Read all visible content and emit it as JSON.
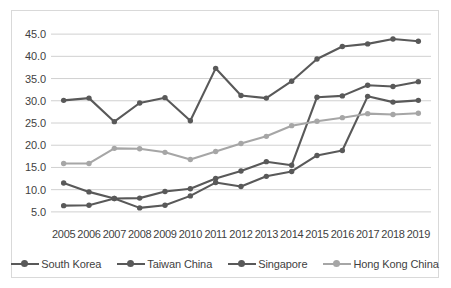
{
  "chart_data": {
    "type": "line",
    "title": "",
    "subtitle": "",
    "xlabel": "",
    "ylabel": "",
    "categories": [
      "2005",
      "2006",
      "2007",
      "2008",
      "2009",
      "2010",
      "2011",
      "2012",
      "2013",
      "2014",
      "2015",
      "2016",
      "2017",
      "2018",
      "2019"
    ],
    "x": [
      2005,
      2006,
      2007,
      2008,
      2009,
      2010,
      2011,
      2012,
      2013,
      2014,
      2015,
      2016,
      2017,
      2018,
      2019
    ],
    "ylim": [
      2.5,
      47.5
    ],
    "yticks": [
      5.0,
      10.0,
      15.0,
      20.0,
      25.0,
      30.0,
      35.0,
      40.0,
      45.0
    ],
    "ytick_labels": [
      "5.0",
      "10.0",
      "15.0",
      "20.0",
      "25.0",
      "30.0",
      "35.0",
      "40.0",
      "45.0"
    ],
    "grid": true,
    "grid_axis": "y",
    "legend_position": "bottom",
    "markers": "circle",
    "series": [
      {
        "name": "South Korea",
        "color": "#595959",
        "values": [
          30.1,
          30.6,
          25.3,
          29.5,
          30.7,
          25.5,
          37.3,
          31.2,
          30.6,
          34.4,
          39.4,
          42.2,
          42.8,
          43.9,
          43.4
        ]
      },
      {
        "name": "Taiwan China",
        "color": "#595959",
        "values": [
          11.5,
          9.5,
          8.0,
          8.1,
          9.6,
          10.2,
          12.5,
          14.2,
          16.3,
          15.5,
          30.8,
          31.1,
          33.5,
          33.2,
          34.3
        ]
      },
      {
        "name": "Singapore",
        "color": "#595959",
        "values": [
          6.4,
          6.5,
          8.0,
          5.9,
          6.5,
          8.6,
          11.6,
          10.7,
          13.0,
          14.1,
          17.7,
          18.8,
          31.0,
          29.7,
          30.1
        ]
      },
      {
        "name": "Hong Kong China",
        "color": "#a6a6a6",
        "values": [
          15.9,
          15.9,
          19.3,
          19.2,
          18.4,
          16.8,
          18.6,
          20.4,
          22.0,
          24.4,
          25.4,
          26.2,
          27.1,
          26.9,
          27.2
        ]
      }
    ]
  },
  "legend": {
    "items": [
      {
        "label": "South Korea"
      },
      {
        "label": "Taiwan China"
      },
      {
        "label": "Singapore"
      },
      {
        "label": "Hong Kong China"
      }
    ]
  },
  "colors": {
    "series_dark": "#595959",
    "series_light": "#a6a6a6",
    "gridline": "#d0d0d0",
    "border": "#d9d9d9",
    "text": "#3f3f3f",
    "background": "#ffffff"
  }
}
